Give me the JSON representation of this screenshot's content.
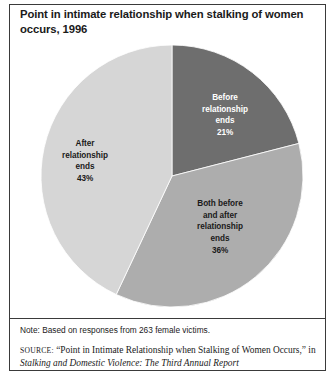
{
  "figure": {
    "title": "Point in intimate relationship when stalking of women occurs, 1996",
    "note": "Note: Based on responses from 263 female victims.",
    "source": {
      "label": "SOURCE:",
      "quoted_title": "“Point in Intimate Relationship when Stalking of Women Occurs,”",
      "connector": "in",
      "italic_title": "Stalking and Domestic Violence: The Third Annual Report"
    }
  },
  "chart_data": {
    "type": "pie",
    "title": "Point in intimate relationship when stalking of women occurs, 1996",
    "categories": [
      "Before relationship ends",
      "Both before and after relationship ends",
      "After relationship ends"
    ],
    "values": [
      21,
      36,
      43
    ],
    "unit": "percent",
    "start_angle_deg": 0,
    "direction": "clockwise",
    "legend": "none",
    "grid": false,
    "slices": [
      {
        "name": "Before relationship ends",
        "label_lines": [
          "Before",
          "relationship",
          "ends"
        ],
        "value": 21,
        "value_label": "21%",
        "color": "#6e6e6e",
        "text_color": "#ffffff",
        "sweep_deg": 75.6
      },
      {
        "name": "Both before and after relationship ends",
        "label_lines": [
          "Both before",
          "and after",
          "relationship",
          "ends"
        ],
        "value": 36,
        "value_label": "36%",
        "color": "#adadad",
        "text_color": "#1a1a1a",
        "sweep_deg": 129.6
      },
      {
        "name": "After relationship ends",
        "label_lines": [
          "After",
          "relationship",
          "ends"
        ],
        "value": 43,
        "value_label": "43%",
        "color": "#d6d6d6",
        "text_color": "#1a1a1a",
        "sweep_deg": 154.8
      }
    ]
  }
}
